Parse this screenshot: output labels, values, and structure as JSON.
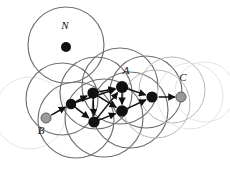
{
  "figure": {
    "name": "overlapping-ball-roadmap-graph",
    "background": "#ffffff",
    "width": 230,
    "height": 174
  },
  "colors": {
    "node_fill": "#111111",
    "terminal_fill": "#9a9a9a",
    "terminal_stroke": "#555555",
    "edge": "#111111",
    "circle_dark": "#6f6f6f",
    "circle_mid": "#b9b9b9",
    "circle_light": "#e2e2e2",
    "label": "#111111"
  },
  "labels": [
    {
      "id": "label-N",
      "text": "N",
      "x": 65,
      "y": 29
    },
    {
      "id": "label-A",
      "text": "A",
      "x": 126,
      "y": 74
    },
    {
      "id": "label-B",
      "text": "B",
      "x": 41,
      "y": 134
    },
    {
      "id": "label-C",
      "text": "C",
      "x": 183,
      "y": 81
    }
  ],
  "circles": [
    {
      "id": "ball-N",
      "cx": 66,
      "cy": 45,
      "r": 38,
      "shade": "dark"
    },
    {
      "id": "ball-1",
      "cx": 30,
      "cy": 113,
      "r": 36,
      "shade": "light"
    },
    {
      "id": "ball-2",
      "cx": 62,
      "cy": 99,
      "r": 36,
      "shade": "dark"
    },
    {
      "id": "ball-3",
      "cx": 76,
      "cy": 120,
      "r": 38,
      "shade": "dark"
    },
    {
      "id": "ball-4",
      "cx": 96,
      "cy": 93,
      "r": 36,
      "shade": "dark"
    },
    {
      "id": "ball-5",
      "cx": 104,
      "cy": 118,
      "r": 39,
      "shade": "dark"
    },
    {
      "id": "ball-6",
      "cx": 120,
      "cy": 86,
      "r": 38,
      "shade": "dark"
    },
    {
      "id": "ball-7",
      "cx": 130,
      "cy": 110,
      "r": 38,
      "shade": "dark"
    },
    {
      "id": "ball-8",
      "cx": 146,
      "cy": 92,
      "r": 36,
      "shade": "dark"
    },
    {
      "id": "ball-9",
      "cx": 156,
      "cy": 104,
      "r": 34,
      "shade": "mid"
    },
    {
      "id": "ball-10",
      "cx": 172,
      "cy": 90,
      "r": 33,
      "shade": "mid"
    },
    {
      "id": "ball-11",
      "cx": 190,
      "cy": 96,
      "r": 33,
      "shade": "light"
    },
    {
      "id": "ball-12",
      "cx": 205,
      "cy": 92,
      "r": 30,
      "shade": "light"
    }
  ],
  "nodes": [
    {
      "id": "node-N",
      "label": "N",
      "x": 66,
      "y": 47,
      "r": 5.0,
      "type": "isolated"
    },
    {
      "id": "node-B",
      "label": "B",
      "x": 46,
      "y": 118,
      "r": 5.0,
      "type": "terminal"
    },
    {
      "id": "node-C",
      "label": "C",
      "x": 181,
      "y": 97,
      "r": 5.0,
      "type": "terminal"
    },
    {
      "id": "node-1",
      "label": "",
      "x": 71,
      "y": 104,
      "r": 5.2,
      "type": "internal"
    },
    {
      "id": "node-2",
      "label": "",
      "x": 93,
      "y": 93,
      "r": 5.6,
      "type": "internal"
    },
    {
      "id": "node-3",
      "label": "",
      "x": 94,
      "y": 122,
      "r": 5.6,
      "type": "internal"
    },
    {
      "id": "node-4",
      "label": "A",
      "x": 122,
      "y": 87,
      "r": 6.0,
      "type": "internal"
    },
    {
      "id": "node-5",
      "label": "",
      "x": 122,
      "y": 111,
      "r": 5.8,
      "type": "internal"
    },
    {
      "id": "node-6",
      "label": "",
      "x": 152,
      "y": 97,
      "r": 5.6,
      "type": "internal"
    }
  ],
  "edges": [
    {
      "id": "edge-B-1",
      "from": "node-B",
      "to": "node-1",
      "arrow": "forward"
    },
    {
      "id": "edge-1-2",
      "from": "node-1",
      "to": "node-2",
      "arrow": "both"
    },
    {
      "id": "edge-1-3",
      "from": "node-1",
      "to": "node-3",
      "arrow": "both"
    },
    {
      "id": "edge-2-3",
      "from": "node-2",
      "to": "node-3",
      "arrow": "both"
    },
    {
      "id": "edge-2-4",
      "from": "node-2",
      "to": "node-4",
      "arrow": "both"
    },
    {
      "id": "edge-2-5",
      "from": "node-2",
      "to": "node-5",
      "arrow": "both"
    },
    {
      "id": "edge-3-5",
      "from": "node-3",
      "to": "node-5",
      "arrow": "both"
    },
    {
      "id": "edge-4-5",
      "from": "node-4",
      "to": "node-5",
      "arrow": "both"
    },
    {
      "id": "edge-4-6",
      "from": "node-4",
      "to": "node-6",
      "arrow": "both"
    },
    {
      "id": "edge-5-6",
      "from": "node-5",
      "to": "node-6",
      "arrow": "both"
    },
    {
      "id": "edge-1-4",
      "from": "node-1",
      "to": "node-4",
      "arrow": "both"
    },
    {
      "id": "edge-3-4",
      "from": "node-3",
      "to": "node-4",
      "arrow": "both"
    },
    {
      "id": "edge-6-C",
      "from": "node-6",
      "to": "node-C",
      "arrow": "forward"
    }
  ]
}
